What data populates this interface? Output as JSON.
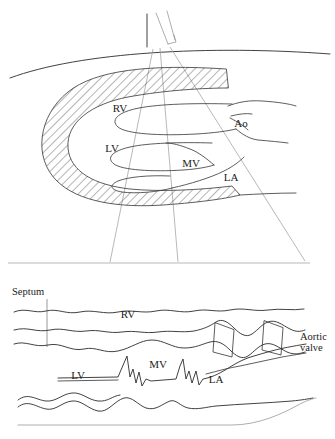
{
  "figure": {
    "background_color": "#ffffff",
    "ink_color": "#2b2b2b",
    "faint_ink_color": "#8a8a8a",
    "panels": [
      {
        "id": "two-dimensional-sector",
        "name": "2D long-axis sector scan",
        "description": "Parasternal long-axis cut of the heart with hatched myocardium, chest wall, and ultrasound sector beam lines"
      },
      {
        "id": "m-mode-sweep",
        "name": "M-mode sweep trace",
        "description": "Time-motion tracing showing septum, RV, LV, mitral valve, aortic valve box and left atrium"
      }
    ]
  },
  "sector_panel": {
    "labels": [
      {
        "key": "rv",
        "text": "RV",
        "x": 120,
        "y": 112,
        "meaning": "right ventricle"
      },
      {
        "key": "lv",
        "text": "LV",
        "x": 112,
        "y": 152,
        "meaning": "left ventricle"
      },
      {
        "key": "ao",
        "text": "Ao",
        "x": 241,
        "y": 127,
        "meaning": "aorta"
      },
      {
        "key": "mv",
        "text": "MV",
        "x": 191,
        "y": 167,
        "meaning": "mitral valve"
      },
      {
        "key": "la",
        "text": "LA",
        "x": 231,
        "y": 181,
        "meaning": "left atrium"
      }
    ],
    "beam_count": 3,
    "transducer_present": true,
    "chest_wall_present": true,
    "hatched_myocardium": true
  },
  "mmode_panel": {
    "labels": [
      {
        "key": "septum",
        "text": "Septum",
        "x": 12,
        "y": 295,
        "meaning": "interventricular septum"
      },
      {
        "key": "rv",
        "text": "RV",
        "x": 128,
        "y": 318,
        "meaning": "right ventricle"
      },
      {
        "key": "lv",
        "text": "LV",
        "x": 78,
        "y": 379,
        "meaning": "left ventricle"
      },
      {
        "key": "mv",
        "text": "MV",
        "x": 158,
        "y": 368,
        "meaning": "mitral valve"
      },
      {
        "key": "la",
        "text": "LA",
        "x": 216,
        "y": 383,
        "meaning": "left atrium"
      },
      {
        "key": "aortic_valve_line1",
        "text": "Aortic",
        "x": 300,
        "y": 340,
        "meaning": "aortic valve annotation line 1"
      },
      {
        "key": "aortic_valve_line2",
        "text": "valve",
        "x": 300,
        "y": 351,
        "meaning": "aortic valve annotation line 2"
      }
    ],
    "trace_count": 7,
    "features": [
      "septum leader line",
      "mitral valve M-shaped excursions",
      "aortic valve box pattern",
      "posterior wall undulation"
    ]
  }
}
